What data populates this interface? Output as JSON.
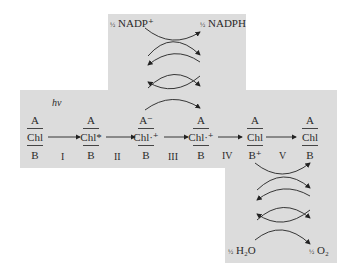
{
  "diagram": {
    "title": "",
    "light_label": "hv",
    "top": {
      "left_label": "NADP⁺",
      "right_label": "NADPH",
      "coef": "½"
    },
    "bottom": {
      "left_label": "H₂O",
      "right_label": "O₂",
      "coef": "½"
    },
    "states": [
      {
        "top": "A",
        "middle": "Chl",
        "bottom": "B"
      },
      {
        "top": "A",
        "middle": "Chl*",
        "bottom": "B"
      },
      {
        "top": "A⁻",
        "middle": "Chl·⁺",
        "bottom": "B"
      },
      {
        "top": "A",
        "middle": "Chl·⁺",
        "bottom": "B"
      },
      {
        "top": "A",
        "middle": "Chl",
        "bottom": "B⁺"
      },
      {
        "top": "A",
        "middle": "Chl",
        "bottom": "B"
      }
    ],
    "steps": [
      "I",
      "II",
      "III",
      "IV",
      "V"
    ],
    "colors": {
      "panel": "#dcdcdc",
      "ink": "#2a2a2a",
      "background": "#ffffff"
    }
  }
}
